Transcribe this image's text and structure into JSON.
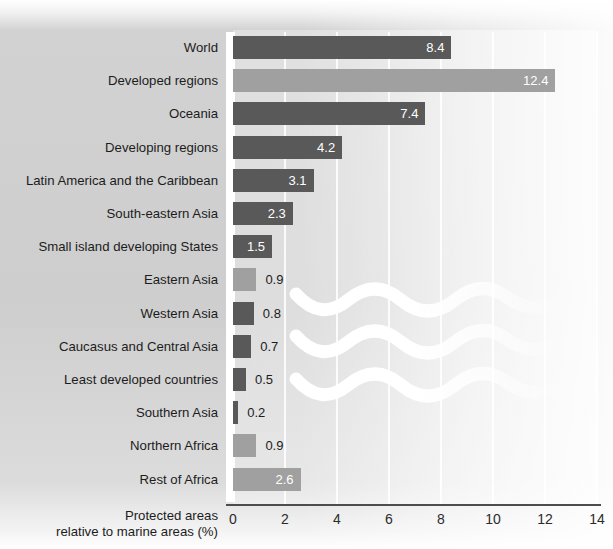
{
  "chart_data": {
    "type": "bar",
    "orientation": "horizontal",
    "title": "",
    "xlabel": "Protected areas relative to marine areas (%)",
    "ylabel": "",
    "xlim": [
      0,
      14
    ],
    "xticks": [
      "0",
      "2",
      "4",
      "6",
      "8",
      "10",
      "12",
      "14"
    ],
    "grid": true,
    "legend": "none",
    "colors": {
      "dark": "#595959",
      "light": "#a0a0a0",
      "value_label_inside": "#ffffff",
      "value_label_outside": "#1c1c1c",
      "axis": "#4d4d4d",
      "gridline": "#ffffff"
    },
    "categories": [
      "World",
      "Developed regions",
      "Oceania",
      "Developing regions",
      "Latin America and the Caribbean",
      "South-eastern Asia",
      "Small island developing States",
      "Eastern Asia",
      "Western Asia",
      "Caucasus and Central Asia",
      "Least developed countries",
      "Southern Asia",
      "Northern Africa",
      "Rest of Africa"
    ],
    "values": [
      8.4,
      12.4,
      7.4,
      4.2,
      3.1,
      2.3,
      1.5,
      0.9,
      0.8,
      0.7,
      0.5,
      0.2,
      0.9,
      2.6
    ],
    "value_labels": [
      "8.4",
      "12.4",
      "7.4",
      "4.2",
      "3.1",
      "2.3",
      "1.5",
      "0.9",
      "0.8",
      "0.7",
      "0.5",
      "0.2",
      "0.9",
      "2.6"
    ],
    "bar_colors": [
      "dark",
      "light",
      "dark",
      "dark",
      "dark",
      "dark",
      "dark",
      "light",
      "dark",
      "dark",
      "dark",
      "dark",
      "light",
      "light"
    ],
    "label_placement": [
      "inside",
      "inside",
      "inside",
      "inside",
      "inside",
      "inside",
      "inside",
      "outside",
      "outside",
      "outside",
      "outside",
      "outside",
      "outside",
      "inside"
    ],
    "decorations": [
      "wave-band-1",
      "wave-band-2",
      "wave-band-3"
    ]
  },
  "rows": [
    {
      "label": "World",
      "value": "8.4"
    },
    {
      "label": "Developed regions",
      "value": "12.4"
    },
    {
      "label": "Oceania",
      "value": "7.4"
    },
    {
      "label": "Developing regions",
      "value": "4.2"
    },
    {
      "label": "Latin America and the Caribbean",
      "value": "3.1"
    },
    {
      "label": "South-eastern Asia",
      "value": "2.3"
    },
    {
      "label": "Small island developing States",
      "value": "1.5"
    },
    {
      "label": "Eastern Asia",
      "value": "0.9"
    },
    {
      "label": "Western Asia",
      "value": "0.8"
    },
    {
      "label": "Caucasus and Central Asia",
      "value": "0.7"
    },
    {
      "label": "Least developed countries",
      "value": "0.5"
    },
    {
      "label": "Southern Asia",
      "value": "0.2"
    },
    {
      "label": "Northern Africa",
      "value": "0.9"
    },
    {
      "label": "Rest of Africa",
      "value": "2.6"
    }
  ],
  "axis": {
    "title_line1": "Protected areas",
    "title_line2": "relative to marine areas (%)",
    "ticks": [
      "0",
      "2",
      "4",
      "6",
      "8",
      "10",
      "12",
      "14"
    ]
  }
}
